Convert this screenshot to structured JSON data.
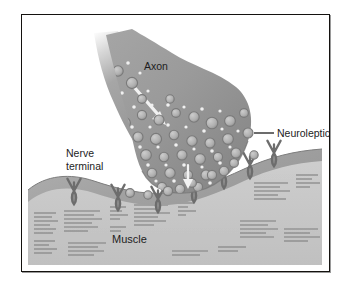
{
  "figure": {
    "background_color": "#ffffff",
    "frame_color": "#14120f"
  },
  "labels": {
    "axon": "Axon",
    "neuroleptics": "Neuroleptics",
    "nerve_terminal_line1": "Nerve",
    "nerve_terminal_line2": "terminal",
    "muscle": "Muscle"
  },
  "colors": {
    "axon_gray": "#9a9a9a",
    "terminal_gray": "#989898",
    "terminal_shade": "#868686",
    "muscle_top": "#a8a8a8",
    "muscle_body": "#c6c6c6",
    "vesicle_fill": "#b4b4b4",
    "vesicle_rim": "#7c7c7c",
    "receptor_gray": "#8c8c8c",
    "striation": "#8a8a8a",
    "arrow_white": "#f4f4f4",
    "leader_line": "#1d1d1d",
    "text": "#1d1d1d"
  },
  "structures": {
    "axon": "axon-shaft",
    "nerve_terminal": "presynaptic-bouton",
    "vesicles": "synaptic-vesicles",
    "neurotransmitter": "neurotransmitter-dots",
    "receptors": "postsynaptic-receptors",
    "muscle": "striated-muscle-fiber",
    "arrow": "transport-arrow"
  },
  "counts": {
    "vesicles": 31,
    "receptors": 9,
    "striation_clusters": 8
  }
}
